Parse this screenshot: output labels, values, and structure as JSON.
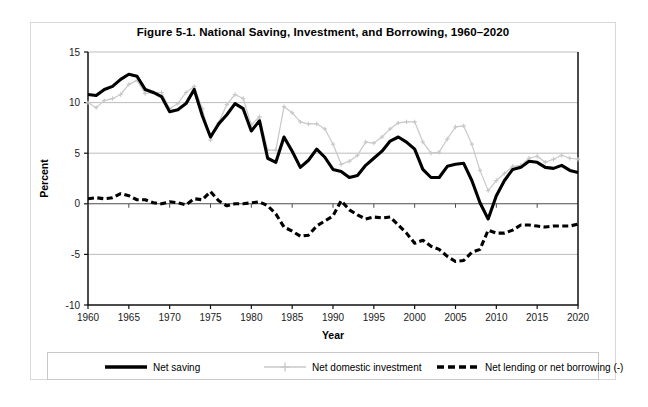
{
  "figure": {
    "title": "Figure 5-1. National Saving, Investment, and Borrowing, 1960–2020",
    "border_color": "#d8d8d8",
    "background": "#ffffff"
  },
  "legend": {
    "items": [
      {
        "label": "Net saving",
        "style": "solid-thick",
        "color": "#000000"
      },
      {
        "label": "Net domestic investment",
        "style": "line-with-markers",
        "color": "#c8c8c8"
      },
      {
        "label": "Net lending or net borrowing (-)",
        "style": "dashed-thick",
        "color": "#000000"
      }
    ]
  },
  "chart_data": {
    "type": "line",
    "title": "Figure 5-1. National Saving, Investment, and Borrowing, 1960–2020",
    "xlabel": "Year",
    "ylabel": "Percent",
    "xlim": [
      1960,
      2020
    ],
    "ylim": [
      -10,
      15
    ],
    "yticks": [
      -10,
      -5,
      0,
      5,
      10,
      15
    ],
    "xticks": [
      1960,
      1965,
      1970,
      1975,
      1980,
      1985,
      1990,
      1995,
      2000,
      2005,
      2010,
      2015,
      2020
    ],
    "grid": "horizontal",
    "legend_position": "bottom",
    "x": [
      1960,
      1961,
      1962,
      1963,
      1964,
      1965,
      1966,
      1967,
      1968,
      1969,
      1970,
      1971,
      1972,
      1973,
      1974,
      1975,
      1976,
      1977,
      1978,
      1979,
      1980,
      1981,
      1982,
      1983,
      1984,
      1985,
      1986,
      1987,
      1988,
      1989,
      1990,
      1991,
      1992,
      1993,
      1994,
      1995,
      1996,
      1997,
      1998,
      1999,
      2000,
      2001,
      2002,
      2003,
      2004,
      2005,
      2006,
      2007,
      2008,
      2009,
      2010,
      2011,
      2012,
      2013,
      2014,
      2015,
      2016,
      2017,
      2018,
      2019,
      2020
    ],
    "series": [
      {
        "name": "Net saving",
        "color": "#000000",
        "style": "solid-thick",
        "values": [
          10.8,
          10.7,
          11.3,
          11.6,
          12.3,
          12.8,
          12.6,
          11.3,
          11.0,
          10.6,
          9.1,
          9.3,
          9.9,
          11.3,
          8.7,
          6.6,
          7.9,
          8.8,
          9.9,
          9.4,
          7.2,
          8.2,
          4.5,
          4.1,
          6.6,
          5.2,
          3.6,
          4.3,
          5.4,
          4.6,
          3.4,
          3.2,
          2.6,
          2.8,
          3.8,
          4.5,
          5.2,
          6.2,
          6.6,
          6.1,
          5.4,
          3.4,
          2.6,
          2.6,
          3.7,
          3.9,
          4.0,
          2.3,
          0.1,
          -1.5,
          0.8,
          2.3,
          3.4,
          3.6,
          4.2,
          4.1,
          3.6,
          3.5,
          3.8,
          3.3,
          3.1
        ]
      },
      {
        "name": "Net domestic investment",
        "color": "#c8c8c8",
        "style": "line-with-markers",
        "values": [
          10.0,
          9.5,
          10.2,
          10.4,
          10.8,
          11.8,
          12.2,
          10.9,
          11.0,
          11.0,
          9.4,
          9.9,
          11.0,
          11.6,
          9.4,
          6.3,
          8.0,
          9.8,
          10.8,
          10.4,
          7.8,
          8.6,
          5.3,
          5.3,
          9.6,
          9.0,
          8.1,
          7.9,
          7.9,
          7.4,
          5.9,
          3.9,
          4.2,
          4.8,
          6.1,
          6.0,
          6.6,
          7.4,
          8.0,
          8.1,
          8.1,
          6.1,
          5.0,
          5.1,
          6.4,
          7.6,
          7.7,
          5.9,
          3.3,
          1.3,
          2.3,
          3.0,
          3.7,
          3.8,
          4.5,
          4.7,
          4.1,
          4.4,
          4.8,
          4.5,
          4.4
        ]
      },
      {
        "name": "Net lending or net borrowing (-)",
        "color": "#000000",
        "style": "dashed-thick",
        "values": [
          0.5,
          0.6,
          0.5,
          0.6,
          1.0,
          0.8,
          0.4,
          0.4,
          0.1,
          0.0,
          0.2,
          0.1,
          -0.1,
          0.5,
          0.4,
          1.2,
          0.3,
          -0.2,
          0.0,
          0.0,
          0.1,
          0.2,
          -0.2,
          -1.0,
          -2.3,
          -2.7,
          -3.2,
          -3.1,
          -2.2,
          -1.7,
          -1.2,
          0.3,
          -0.6,
          -1.1,
          -1.5,
          -1.3,
          -1.4,
          -1.3,
          -2.1,
          -2.9,
          -3.9,
          -3.6,
          -4.2,
          -4.5,
          -5.2,
          -5.7,
          -5.6,
          -4.8,
          -4.5,
          -2.6,
          -2.9,
          -2.9,
          -2.6,
          -2.1,
          -2.1,
          -2.2,
          -2.3,
          -2.2,
          -2.2,
          -2.2,
          -2.0
        ]
      }
    ]
  }
}
